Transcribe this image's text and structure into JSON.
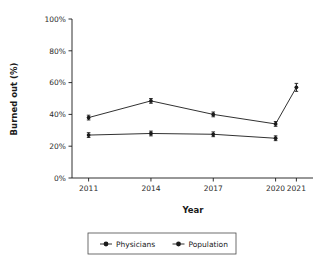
{
  "chart_data": {
    "type": "line",
    "title": "",
    "xlabel": "Year",
    "ylabel": "Burned out (%)",
    "x": [
      2011,
      2014,
      2017,
      2020,
      2021
    ],
    "categories": [
      "2011",
      "2014",
      "2017",
      "2020",
      "2021"
    ],
    "xtick_labels": [
      "2011",
      "2014",
      "2017",
      "2020",
      "2021"
    ],
    "ytick_labels": [
      "0%",
      "20%",
      "40%",
      "60%",
      "80%",
      "100%"
    ],
    "ytick_values": [
      0,
      20,
      40,
      60,
      80,
      100
    ],
    "ylim": [
      0,
      100
    ],
    "xlim": [
      2010.2,
      2021.8
    ],
    "grid": false,
    "legend_position": "bottom",
    "error_bars": true,
    "series": [
      {
        "name": "Physicians",
        "color": "#1a1a1a",
        "x": [
          2011,
          2014,
          2017,
          2020,
          2021
        ],
        "values": [
          38,
          48.5,
          40,
          34,
          57
        ],
        "errors": [
          1.5,
          1.5,
          1.5,
          1.5,
          2.5
        ]
      },
      {
        "name": "Population",
        "color": "#1a1a1a",
        "x": [
          2011,
          2014,
          2017,
          2020
        ],
        "values": [
          27,
          28,
          27.5,
          25
        ],
        "errors": [
          1.5,
          1.5,
          1.5,
          1.5
        ]
      }
    ],
    "legend": [
      {
        "label": "Physicians",
        "marker": "circle",
        "color": "#1a1a1a"
      },
      {
        "label": "Population",
        "marker": "circle",
        "color": "#1a1a1a"
      }
    ]
  }
}
